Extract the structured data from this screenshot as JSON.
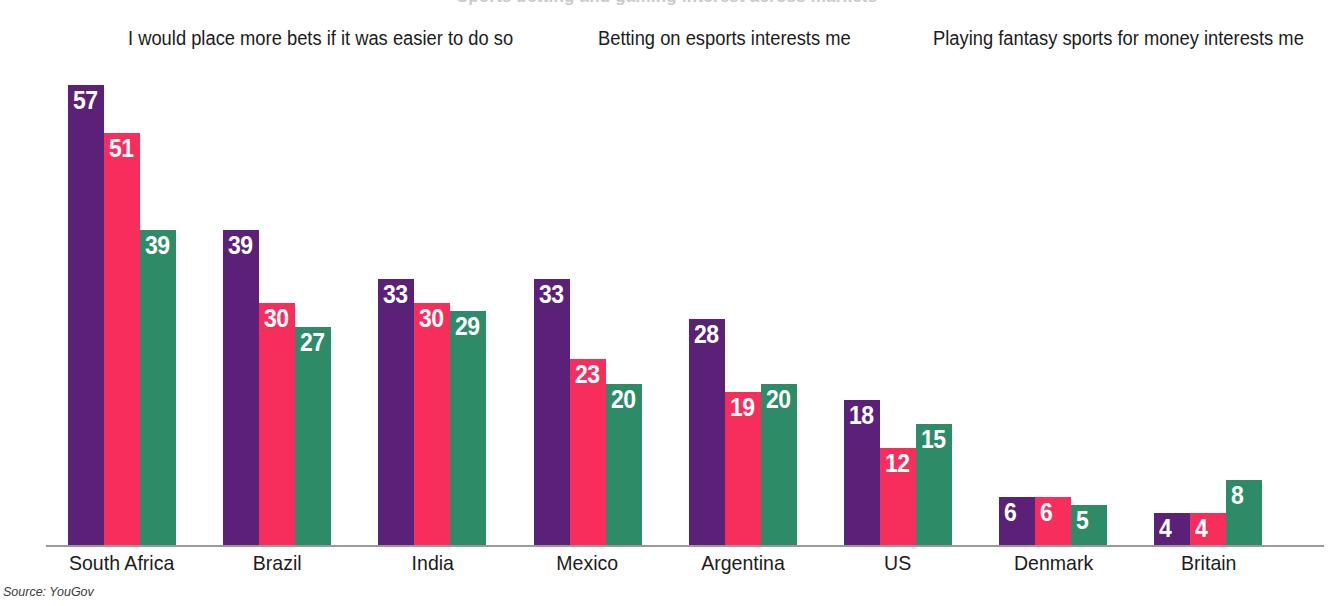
{
  "title": {
    "text": "Sports betting and gaming interest across markets",
    "clipped": true
  },
  "legend": {
    "position": "top",
    "items": [
      {
        "label": "I would place more bets if it was easier to do so",
        "color": "#5B2178",
        "swatch_name": "legend-swatch-purple"
      },
      {
        "label": "Betting on esports interests me",
        "color": "#F72E5C",
        "swatch_name": "legend-swatch-pink"
      },
      {
        "label": "Playing fantasy sports for money interests me",
        "color": "#2E8B68",
        "swatch_name": "legend-swatch-green"
      }
    ]
  },
  "source": "Source: YouGov",
  "chart_data": {
    "type": "bar",
    "title": "Sports betting and gaming interest across markets",
    "xlabel": "",
    "ylabel": "",
    "ylim": [
      0,
      60
    ],
    "grid": false,
    "legend_position": "top",
    "value_suffix": "",
    "categories": [
      "South Africa",
      "Brazil",
      "India",
      "Mexico",
      "Argentina",
      "US",
      "Denmark",
      "Britain"
    ],
    "series": [
      {
        "name": "I would place more bets if it was easier to do so",
        "color": "#5B2178",
        "values": [
          57,
          39,
          33,
          33,
          28,
          18,
          6,
          4
        ]
      },
      {
        "name": "Betting on esports interests me",
        "color": "#F72E5C",
        "values": [
          51,
          30,
          30,
          23,
          19,
          12,
          6,
          4
        ]
      },
      {
        "name": "Playing fantasy sports for money interests me",
        "color": "#2E8B68",
        "values": [
          39,
          27,
          29,
          20,
          20,
          15,
          5,
          8
        ]
      }
    ]
  }
}
